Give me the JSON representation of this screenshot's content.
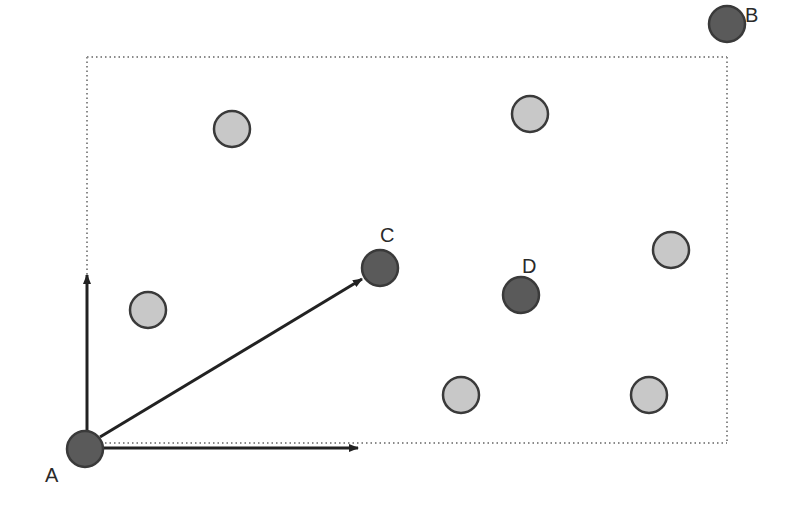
{
  "diagram": {
    "colors": {
      "background": "#ffffff",
      "dark_point_fill": "#5a5a5a",
      "light_point_fill": "#c8c8c8",
      "point_stroke": "#3a3a3a",
      "arrow": "#222222",
      "dotted": "#8a8a8a"
    },
    "point_radius": 18,
    "bounding_box": {
      "left": 87,
      "top": 57,
      "right": 727,
      "bottom": 443,
      "style": "dotted"
    },
    "labeled_points": [
      {
        "label": "A",
        "x": 85,
        "y": 449,
        "label_x": 45,
        "label_y": 482
      },
      {
        "label": "B",
        "x": 727,
        "y": 24,
        "label_x": 745,
        "label_y": 22
      },
      {
        "label": "C",
        "x": 380,
        "y": 268,
        "label_x": 380,
        "label_y": 242
      },
      {
        "label": "D",
        "x": 521,
        "y": 295,
        "label_x": 522,
        "label_y": 273
      }
    ],
    "unlabeled_points": [
      {
        "x": 232,
        "y": 129
      },
      {
        "x": 530,
        "y": 114
      },
      {
        "x": 148,
        "y": 310
      },
      {
        "x": 671,
        "y": 250
      },
      {
        "x": 461,
        "y": 395
      },
      {
        "x": 649,
        "y": 395
      }
    ],
    "arrows": [
      {
        "name": "vertical-axis-arrow",
        "from": "A",
        "x1": 87,
        "y1": 432,
        "x2": 87,
        "y2": 275
      },
      {
        "name": "horizontal-axis-arrow",
        "from": "A",
        "x1": 103,
        "y1": 448,
        "x2": 358,
        "y2": 448
      },
      {
        "name": "a-to-c-arrow",
        "from": "A",
        "to": "C",
        "x1": 100,
        "y1": 437,
        "x2": 362,
        "y2": 279
      }
    ]
  }
}
